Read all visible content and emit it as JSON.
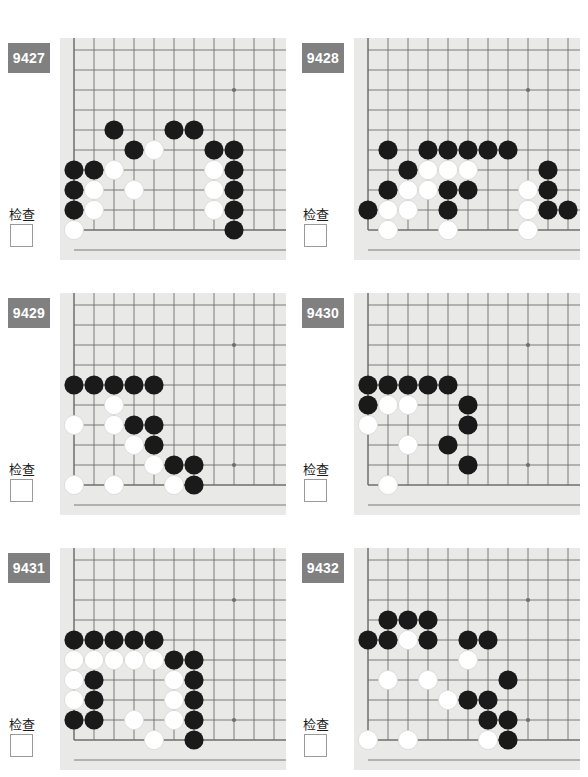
{
  "page": {
    "columns": 2,
    "rows": 3
  },
  "labels": {
    "check_text": "检查",
    "badge_color": "#808080",
    "badge_text_color": "#ffffff",
    "board_background": "#e9e9e7",
    "grid_line_color": "#6e6e6e",
    "black_stone_color": "#1a1a1a",
    "white_stone_color": "#ffffff",
    "page_background": "#ffffff"
  },
  "board_geometry": {
    "cell": 20,
    "origin_x": 14,
    "origin_y": 12,
    "cols": 11,
    "rows": 10,
    "stone_radius": 9.6,
    "star_points": [
      [
        8,
        2
      ],
      [
        8,
        8
      ]
    ],
    "edge_left_col": 0,
    "edge_bottom_row": 9
  },
  "problems": [
    {
      "id": "9427",
      "check_text": "检查",
      "stones": [
        {
          "c": 2,
          "r": 4,
          "color": "black"
        },
        {
          "c": 5,
          "r": 4,
          "color": "black"
        },
        {
          "c": 6,
          "r": 4,
          "color": "black"
        },
        {
          "c": 3,
          "r": 5,
          "color": "black"
        },
        {
          "c": 4,
          "r": 5,
          "color": "white"
        },
        {
          "c": 7,
          "r": 5,
          "color": "black"
        },
        {
          "c": 8,
          "r": 5,
          "color": "black"
        },
        {
          "c": 0,
          "r": 6,
          "color": "black"
        },
        {
          "c": 1,
          "r": 6,
          "color": "black"
        },
        {
          "c": 2,
          "r": 6,
          "color": "white"
        },
        {
          "c": 7,
          "r": 6,
          "color": "white"
        },
        {
          "c": 8,
          "r": 6,
          "color": "black"
        },
        {
          "c": 0,
          "r": 7,
          "color": "black"
        },
        {
          "c": 1,
          "r": 7,
          "color": "white"
        },
        {
          "c": 3,
          "r": 7,
          "color": "white"
        },
        {
          "c": 7,
          "r": 7,
          "color": "white"
        },
        {
          "c": 8,
          "r": 7,
          "color": "black"
        },
        {
          "c": 0,
          "r": 8,
          "color": "black"
        },
        {
          "c": 1,
          "r": 8,
          "color": "white"
        },
        {
          "c": 7,
          "r": 8,
          "color": "white"
        },
        {
          "c": 8,
          "r": 8,
          "color": "black"
        },
        {
          "c": 0,
          "r": 9,
          "color": "white"
        },
        {
          "c": 8,
          "r": 9,
          "color": "black"
        }
      ]
    },
    {
      "id": "9428",
      "check_text": "检查",
      "stones": [
        {
          "c": 1,
          "r": 5,
          "color": "black"
        },
        {
          "c": 3,
          "r": 5,
          "color": "black"
        },
        {
          "c": 4,
          "r": 5,
          "color": "black"
        },
        {
          "c": 5,
          "r": 5,
          "color": "black"
        },
        {
          "c": 6,
          "r": 5,
          "color": "black"
        },
        {
          "c": 7,
          "r": 5,
          "color": "black"
        },
        {
          "c": 2,
          "r": 6,
          "color": "black"
        },
        {
          "c": 3,
          "r": 6,
          "color": "white"
        },
        {
          "c": 4,
          "r": 6,
          "color": "white"
        },
        {
          "c": 5,
          "r": 6,
          "color": "white"
        },
        {
          "c": 9,
          "r": 6,
          "color": "black"
        },
        {
          "c": 1,
          "r": 7,
          "color": "black"
        },
        {
          "c": 2,
          "r": 7,
          "color": "white"
        },
        {
          "c": 3,
          "r": 7,
          "color": "white"
        },
        {
          "c": 4,
          "r": 7,
          "color": "black"
        },
        {
          "c": 5,
          "r": 7,
          "color": "black"
        },
        {
          "c": 8,
          "r": 7,
          "color": "white"
        },
        {
          "c": 9,
          "r": 7,
          "color": "black"
        },
        {
          "c": 0,
          "r": 8,
          "color": "black"
        },
        {
          "c": 1,
          "r": 8,
          "color": "white"
        },
        {
          "c": 2,
          "r": 8,
          "color": "white"
        },
        {
          "c": 4,
          "r": 8,
          "color": "black"
        },
        {
          "c": 8,
          "r": 8,
          "color": "white"
        },
        {
          "c": 9,
          "r": 8,
          "color": "black"
        },
        {
          "c": 10,
          "r": 8,
          "color": "black"
        },
        {
          "c": 1,
          "r": 9,
          "color": "white"
        },
        {
          "c": 4,
          "r": 9,
          "color": "white"
        },
        {
          "c": 8,
          "r": 9,
          "color": "white"
        }
      ]
    },
    {
      "id": "9429",
      "check_text": "检查",
      "stones": [
        {
          "c": 0,
          "r": 4,
          "color": "black"
        },
        {
          "c": 1,
          "r": 4,
          "color": "black"
        },
        {
          "c": 2,
          "r": 4,
          "color": "black"
        },
        {
          "c": 3,
          "r": 4,
          "color": "black"
        },
        {
          "c": 4,
          "r": 4,
          "color": "black"
        },
        {
          "c": 2,
          "r": 5,
          "color": "white"
        },
        {
          "c": 0,
          "r": 6,
          "color": "white"
        },
        {
          "c": 2,
          "r": 6,
          "color": "white"
        },
        {
          "c": 3,
          "r": 6,
          "color": "black"
        },
        {
          "c": 4,
          "r": 6,
          "color": "black"
        },
        {
          "c": 3,
          "r": 7,
          "color": "white"
        },
        {
          "c": 4,
          "r": 7,
          "color": "black"
        },
        {
          "c": 4,
          "r": 8,
          "color": "white"
        },
        {
          "c": 5,
          "r": 8,
          "color": "black"
        },
        {
          "c": 6,
          "r": 8,
          "color": "black"
        },
        {
          "c": 0,
          "r": 9,
          "color": "white"
        },
        {
          "c": 2,
          "r": 9,
          "color": "white"
        },
        {
          "c": 5,
          "r": 9,
          "color": "white"
        },
        {
          "c": 6,
          "r": 9,
          "color": "black"
        }
      ]
    },
    {
      "id": "9430",
      "check_text": "检查",
      "stones": [
        {
          "c": 0,
          "r": 4,
          "color": "black"
        },
        {
          "c": 1,
          "r": 4,
          "color": "black"
        },
        {
          "c": 2,
          "r": 4,
          "color": "black"
        },
        {
          "c": 3,
          "r": 4,
          "color": "black"
        },
        {
          "c": 4,
          "r": 4,
          "color": "black"
        },
        {
          "c": 0,
          "r": 5,
          "color": "black"
        },
        {
          "c": 1,
          "r": 5,
          "color": "white"
        },
        {
          "c": 2,
          "r": 5,
          "color": "white"
        },
        {
          "c": 5,
          "r": 5,
          "color": "black"
        },
        {
          "c": 0,
          "r": 6,
          "color": "white"
        },
        {
          "c": 5,
          "r": 6,
          "color": "black"
        },
        {
          "c": 2,
          "r": 7,
          "color": "white"
        },
        {
          "c": 4,
          "r": 7,
          "color": "black"
        },
        {
          "c": 5,
          "r": 8,
          "color": "black"
        },
        {
          "c": 1,
          "r": 9,
          "color": "white"
        }
      ]
    },
    {
      "id": "9431",
      "check_text": "检查",
      "stones": [
        {
          "c": 0,
          "r": 4,
          "color": "black"
        },
        {
          "c": 1,
          "r": 4,
          "color": "black"
        },
        {
          "c": 2,
          "r": 4,
          "color": "black"
        },
        {
          "c": 3,
          "r": 4,
          "color": "black"
        },
        {
          "c": 4,
          "r": 4,
          "color": "black"
        },
        {
          "c": 0,
          "r": 5,
          "color": "white"
        },
        {
          "c": 1,
          "r": 5,
          "color": "white"
        },
        {
          "c": 2,
          "r": 5,
          "color": "white"
        },
        {
          "c": 3,
          "r": 5,
          "color": "white"
        },
        {
          "c": 4,
          "r": 5,
          "color": "white"
        },
        {
          "c": 5,
          "r": 5,
          "color": "black"
        },
        {
          "c": 6,
          "r": 5,
          "color": "black"
        },
        {
          "c": 0,
          "r": 6,
          "color": "white"
        },
        {
          "c": 1,
          "r": 6,
          "color": "black"
        },
        {
          "c": 5,
          "r": 6,
          "color": "white"
        },
        {
          "c": 6,
          "r": 6,
          "color": "black"
        },
        {
          "c": 0,
          "r": 7,
          "color": "white"
        },
        {
          "c": 1,
          "r": 7,
          "color": "black"
        },
        {
          "c": 5,
          "r": 7,
          "color": "white"
        },
        {
          "c": 6,
          "r": 7,
          "color": "black"
        },
        {
          "c": 0,
          "r": 8,
          "color": "black"
        },
        {
          "c": 1,
          "r": 8,
          "color": "black"
        },
        {
          "c": 3,
          "r": 8,
          "color": "white"
        },
        {
          "c": 5,
          "r": 8,
          "color": "white"
        },
        {
          "c": 6,
          "r": 8,
          "color": "black"
        },
        {
          "c": 4,
          "r": 9,
          "color": "white"
        },
        {
          "c": 6,
          "r": 9,
          "color": "black"
        }
      ]
    },
    {
      "id": "9432",
      "check_text": "检查",
      "stones": [
        {
          "c": 1,
          "r": 3,
          "color": "black"
        },
        {
          "c": 2,
          "r": 3,
          "color": "black"
        },
        {
          "c": 3,
          "r": 3,
          "color": "black"
        },
        {
          "c": 0,
          "r": 4,
          "color": "black"
        },
        {
          "c": 1,
          "r": 4,
          "color": "black"
        },
        {
          "c": 2,
          "r": 4,
          "color": "white"
        },
        {
          "c": 3,
          "r": 4,
          "color": "black"
        },
        {
          "c": 5,
          "r": 4,
          "color": "black"
        },
        {
          "c": 6,
          "r": 4,
          "color": "black"
        },
        {
          "c": 5,
          "r": 5,
          "color": "white"
        },
        {
          "c": 1,
          "r": 6,
          "color": "white"
        },
        {
          "c": 3,
          "r": 6,
          "color": "white"
        },
        {
          "c": 7,
          "r": 6,
          "color": "black"
        },
        {
          "c": 4,
          "r": 7,
          "color": "white"
        },
        {
          "c": 5,
          "r": 7,
          "color": "black"
        },
        {
          "c": 6,
          "r": 7,
          "color": "black"
        },
        {
          "c": 6,
          "r": 8,
          "color": "black"
        },
        {
          "c": 7,
          "r": 8,
          "color": "black"
        },
        {
          "c": 0,
          "r": 9,
          "color": "white"
        },
        {
          "c": 2,
          "r": 9,
          "color": "white"
        },
        {
          "c": 6,
          "r": 9,
          "color": "white"
        },
        {
          "c": 7,
          "r": 9,
          "color": "black"
        }
      ]
    }
  ]
}
